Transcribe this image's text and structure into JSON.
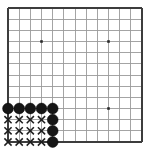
{
  "figure": {
    "kind": "go-board-diagram",
    "width": 144,
    "height": 158,
    "background_color": "#ffffff"
  },
  "board": {
    "origin_x": 8.0,
    "origin_y": 8.0,
    "cell": 11.17,
    "columns": 13,
    "rows": 13,
    "grid_color": "#9a9a9a",
    "edge_color": "#3d3d3d",
    "grid_line_width": 0.9,
    "edge_line_width": 1.7,
    "edges": {
      "left": true,
      "top": true,
      "right": true,
      "bottom": true
    }
  },
  "star_points": {
    "color": "#2b2b2b",
    "size": 2.6,
    "points": [
      {
        "col": 3,
        "row": 3,
        "x": 41.5,
        "y": 41.5
      },
      {
        "col": 9,
        "row": 3,
        "x": 108.5,
        "y": 41.5
      },
      {
        "col": 9,
        "row": 9,
        "x": 108.5,
        "y": 108.5
      }
    ]
  },
  "stones": {
    "black_color": "#161616",
    "radius": 5.4,
    "black": [
      {
        "col": 0,
        "row": 9,
        "x": 8.0,
        "y": 108.5
      },
      {
        "col": 1,
        "row": 9,
        "x": 19.2,
        "y": 108.5
      },
      {
        "col": 2,
        "row": 9,
        "x": 30.3,
        "y": 108.5
      },
      {
        "col": 3,
        "row": 9,
        "x": 41.5,
        "y": 108.5
      },
      {
        "col": 4,
        "row": 9,
        "x": 52.7,
        "y": 108.5
      },
      {
        "col": 4,
        "row": 10,
        "x": 52.7,
        "y": 119.7
      },
      {
        "col": 4,
        "row": 11,
        "x": 52.7,
        "y": 130.8
      },
      {
        "col": 4,
        "row": 12,
        "x": 52.7,
        "y": 142.0
      }
    ]
  },
  "marks": {
    "symbol": "x-mark",
    "color": "#1e1e1e",
    "arm": 3.6,
    "stroke_width": 1.5,
    "x_marks": [
      {
        "col": 0,
        "row": 10,
        "x": 8.0,
        "y": 119.7
      },
      {
        "col": 1,
        "row": 10,
        "x": 19.2,
        "y": 119.7
      },
      {
        "col": 2,
        "row": 10,
        "x": 30.3,
        "y": 119.7
      },
      {
        "col": 3,
        "row": 10,
        "x": 41.5,
        "y": 119.7
      },
      {
        "col": 0,
        "row": 11,
        "x": 8.0,
        "y": 130.8
      },
      {
        "col": 1,
        "row": 11,
        "x": 19.2,
        "y": 130.8
      },
      {
        "col": 2,
        "row": 11,
        "x": 30.3,
        "y": 130.8
      },
      {
        "col": 3,
        "row": 11,
        "x": 41.5,
        "y": 130.8
      },
      {
        "col": 0,
        "row": 12,
        "x": 8.0,
        "y": 142.0
      },
      {
        "col": 1,
        "row": 12,
        "x": 19.2,
        "y": 142.0
      },
      {
        "col": 2,
        "row": 12,
        "x": 30.3,
        "y": 142.0
      },
      {
        "col": 3,
        "row": 12,
        "x": 41.5,
        "y": 142.0
      }
    ]
  }
}
